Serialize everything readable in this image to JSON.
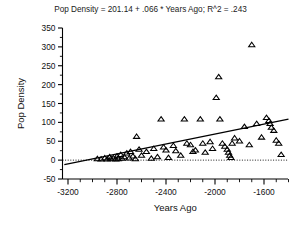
{
  "chart_data": {
    "type": "scatter",
    "title": "Pop Density = 201.14 + .066 * Years Ago; R^2 = .243",
    "xlabel": "Years Ago",
    "ylabel": "Pop Density",
    "xlim": [
      -3250,
      -1400
    ],
    "ylim": [
      -50,
      350
    ],
    "grid": false,
    "legend": "none",
    "y_ticks": [
      -50,
      0,
      50,
      100,
      150,
      200,
      250,
      300,
      350
    ],
    "y_tick_labels": [
      "-50",
      "0",
      "50",
      "100",
      "150",
      "200",
      "250",
      "300",
      "350"
    ],
    "x_ticks": [
      -3200,
      -2800,
      -2400,
      -2000,
      -1600
    ],
    "x_tick_labels": [
      "-3200",
      "-2800",
      "-2400",
      "-2000",
      "-1600"
    ],
    "x_minor_step": 100,
    "marker": "open-triangle",
    "regression": {
      "intercept": 201.14,
      "slope": 0.066,
      "r_squared": 0.243,
      "x_start": -3230,
      "x_end": -1400
    },
    "reference_line": {
      "orientation": "horizontal",
      "y": 0,
      "style": "dotted"
    },
    "points": [
      {
        "x": -2960,
        "y": 3
      },
      {
        "x": -2930,
        "y": 2
      },
      {
        "x": -2900,
        "y": 5
      },
      {
        "x": -2880,
        "y": 2
      },
      {
        "x": -2860,
        "y": 8
      },
      {
        "x": -2850,
        "y": 3
      },
      {
        "x": -2830,
        "y": 5
      },
      {
        "x": -2810,
        "y": 2
      },
      {
        "x": -2800,
        "y": 10
      },
      {
        "x": -2790,
        "y": 3
      },
      {
        "x": -2770,
        "y": 14
      },
      {
        "x": -2760,
        "y": 4
      },
      {
        "x": -2740,
        "y": 8
      },
      {
        "x": -2720,
        "y": 18
      },
      {
        "x": -2700,
        "y": 5
      },
      {
        "x": -2690,
        "y": 22
      },
      {
        "x": -2670,
        "y": 10
      },
      {
        "x": -2650,
        "y": 3
      },
      {
        "x": -2640,
        "y": 62
      },
      {
        "x": -2620,
        "y": 28
      },
      {
        "x": -2600,
        "y": 12
      },
      {
        "x": -2560,
        "y": 22
      },
      {
        "x": -2520,
        "y": 4
      },
      {
        "x": -2500,
        "y": 30
      },
      {
        "x": -2470,
        "y": 8
      },
      {
        "x": -2440,
        "y": 108
      },
      {
        "x": -2420,
        "y": 34
      },
      {
        "x": -2400,
        "y": 26
      },
      {
        "x": -2380,
        "y": 6
      },
      {
        "x": -2340,
        "y": 38
      },
      {
        "x": -2320,
        "y": 24
      },
      {
        "x": -2280,
        "y": 12
      },
      {
        "x": -2250,
        "y": 108
      },
      {
        "x": -2230,
        "y": 44
      },
      {
        "x": -2200,
        "y": 40
      },
      {
        "x": -2180,
        "y": 22
      },
      {
        "x": -2160,
        "y": 26
      },
      {
        "x": -2120,
        "y": 108
      },
      {
        "x": -2100,
        "y": 44
      },
      {
        "x": -2080,
        "y": 20
      },
      {
        "x": -2040,
        "y": 48
      },
      {
        "x": -2020,
        "y": 30
      },
      {
        "x": -1990,
        "y": 165
      },
      {
        "x": -1970,
        "y": 220
      },
      {
        "x": -1960,
        "y": 108
      },
      {
        "x": -1940,
        "y": 44
      },
      {
        "x": -1920,
        "y": 36
      },
      {
        "x": -1900,
        "y": 28
      },
      {
        "x": -1890,
        "y": 20
      },
      {
        "x": -1880,
        "y": 12
      },
      {
        "x": -1870,
        "y": 6
      },
      {
        "x": -1860,
        "y": 44
      },
      {
        "x": -1840,
        "y": 58
      },
      {
        "x": -1800,
        "y": 50
      },
      {
        "x": -1760,
        "y": 88
      },
      {
        "x": -1720,
        "y": 40
      },
      {
        "x": -1700,
        "y": 305
      },
      {
        "x": -1660,
        "y": 96
      },
      {
        "x": -1620,
        "y": 60
      },
      {
        "x": -1580,
        "y": 112
      },
      {
        "x": -1560,
        "y": 104
      },
      {
        "x": -1550,
        "y": 96
      },
      {
        "x": -1540,
        "y": 86
      },
      {
        "x": -1520,
        "y": 78
      },
      {
        "x": -1500,
        "y": 52
      },
      {
        "x": -1480,
        "y": 44
      },
      {
        "x": -1460,
        "y": 14
      }
    ]
  }
}
